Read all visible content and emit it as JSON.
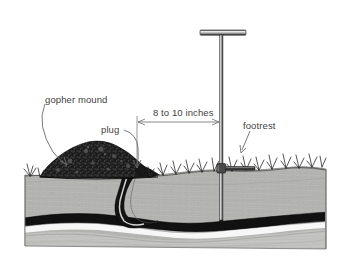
{
  "figure": {
    "background_color": "#ffffff",
    "ink_color": "#1a1a1a",
    "label_color": "#3f3f3f",
    "labels": {
      "gopher_mound": "gopher mound",
      "plug": "plug",
      "dimension": "8 to 10 inches",
      "footrest": "footrest"
    },
    "parts": {
      "probe_handle": "t-handle",
      "probe_shaft": "probe-shaft",
      "footrest_bar": "footrest-bar",
      "mound": "soil-mound",
      "plug_tunnel": "plug-tunnel",
      "main_burrow": "main-burrow",
      "soil_block": "soil-cross-section",
      "grass": "grass-tufts"
    },
    "dimension_line": {
      "value": "8 to 10 inches",
      "from_x": 137,
      "to_x": 222,
      "y": 122
    }
  }
}
